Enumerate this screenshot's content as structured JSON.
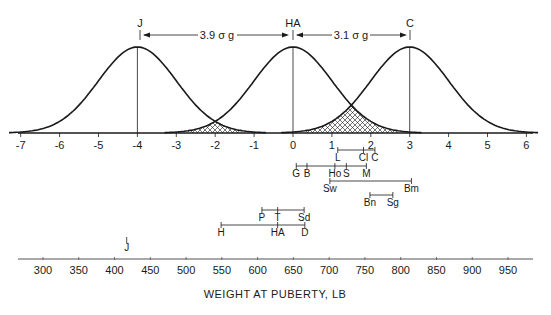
{
  "chart_data": {
    "type": "line",
    "title": "",
    "xlabel": "WEIGHT AT PUBERTY, LB",
    "top_axis": {
      "label": "",
      "units": "sigma",
      "ticks": [
        -7,
        -6,
        -5,
        -4,
        -3,
        -2,
        -1,
        0,
        1,
        2,
        3,
        4,
        5,
        6
      ],
      "range": [
        -7,
        6
      ]
    },
    "bottom_axis": {
      "ticks": [
        300,
        350,
        400,
        450,
        500,
        550,
        600,
        650,
        700,
        750,
        800,
        850,
        900,
        950
      ],
      "range": [
        270,
        965
      ]
    },
    "series": [
      {
        "name": "J",
        "mean_sigma": -4,
        "distribution": "normal",
        "sd_sigma": 1
      },
      {
        "name": "HA",
        "mean_sigma": 0,
        "distribution": "normal",
        "sd_sigma": 1
      },
      {
        "name": "C",
        "mean_sigma": 3,
        "distribution": "normal",
        "sd_sigma": 1
      }
    ],
    "annotations": [
      {
        "text": "3.9 σ g",
        "from": "J",
        "to": "HA",
        "type": "distance-arrow"
      },
      {
        "text": "3.1 σ g",
        "from": "HA",
        "to": "C",
        "type": "distance-arrow"
      }
    ],
    "overlap_regions": [
      {
        "between": [
          "J",
          "HA"
        ],
        "approx_sigma_range": [
          -2.7,
          -1.3
        ],
        "fill": "crosshatch"
      },
      {
        "between": [
          "HA",
          "C"
        ],
        "approx_sigma_range": [
          0.3,
          2.7
        ],
        "fill": "crosshatch"
      }
    ],
    "breed_ranges": [
      {
        "row": 1,
        "markers": [
          {
            "label": "L",
            "lb": 712
          },
          {
            "label": "Cl",
            "lb": 748
          },
          {
            "label": "C",
            "lb": 764
          }
        ]
      },
      {
        "row": 2,
        "markers": [
          {
            "label": "G",
            "lb": 654
          },
          {
            "label": "B",
            "lb": 669
          },
          {
            "label": "Ho",
            "lb": 708
          },
          {
            "label": "S",
            "lb": 724
          },
          {
            "label": "M",
            "lb": 752
          }
        ]
      },
      {
        "row": 3,
        "markers": [
          {
            "label": "Sw",
            "lb": 701
          },
          {
            "label": "Bm",
            "lb": 815
          }
        ]
      },
      {
        "row": 4,
        "markers": [
          {
            "label": "Bn",
            "lb": 757
          },
          {
            "label": "Sg",
            "lb": 789
          }
        ]
      },
      {
        "row": 5,
        "markers": [
          {
            "label": "P",
            "lb": 606
          },
          {
            "label": "T",
            "lb": 628
          },
          {
            "label": "Sd",
            "lb": 665
          }
        ]
      },
      {
        "row": 6,
        "markers": [
          {
            "label": "H",
            "lb": 549
          },
          {
            "label": "HA",
            "lb": 628
          },
          {
            "label": "D",
            "lb": 666
          }
        ]
      },
      {
        "row": 7,
        "markers": [
          {
            "label": "J",
            "lb": 417
          }
        ]
      }
    ],
    "grid": false,
    "legend": "none"
  },
  "labels": {
    "peak_j": "J",
    "peak_ha": "HA",
    "peak_c": "C",
    "arrow_left": "3.9 σ g",
    "arrow_right": "3.1 σ g",
    "xlabel": "WEIGHT AT PUBERTY, LB"
  },
  "colors": {
    "ink": "#1a1a1a",
    "background": "#ffffff"
  }
}
